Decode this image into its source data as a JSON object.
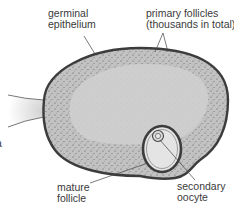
{
  "diagram": {
    "labels": {
      "germinal_epithelium": [
        "germinal",
        "epithelium"
      ],
      "primary_follicles": [
        "primary follicles",
        "(thousands in total)"
      ],
      "mature_follicle": [
        "mature",
        "follicle"
      ],
      "secondary_oocyte": [
        "secondary",
        "oocyte"
      ],
      "clipped_left": "a"
    },
    "colors": {
      "outline": "#3c3c3c",
      "interior": "#cfcfcf",
      "cortex": "#bdbdbd",
      "follicle_fill": "#e2e2e2",
      "text": "#3a3a3a"
    }
  }
}
